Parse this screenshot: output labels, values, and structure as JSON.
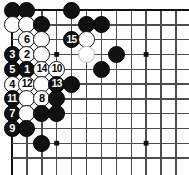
{
  "figure": {
    "kind": "go-board-diagram",
    "width": 189,
    "height": 175,
    "background_color": "#ffffff"
  },
  "board": {
    "line_color": "#4d4d4d",
    "edge_line_color": "#111111",
    "star_point_color": "#111111",
    "origin_x": 12,
    "origin_y": 10,
    "spacing_x": 14.9,
    "spacing_y": 14.8,
    "columns": 12,
    "rows": 11,
    "shows_top_edge": true,
    "shows_left_edge": true,
    "star_points": [
      {
        "col": 4,
        "row": 4
      },
      {
        "col": 10,
        "row": 4
      },
      {
        "col": 4,
        "row": 10
      },
      {
        "col": 10,
        "row": 10
      }
    ]
  },
  "stone_style": {
    "diameter": 17,
    "black_fill": "#111111",
    "black_label_color": "#ffffff",
    "white_fill": "#ffffff",
    "white_outline": "#151515",
    "white_faint_outline": "#b9b9b9"
  },
  "stones": [
    {
      "id": "s-b-c1r1",
      "color": "black",
      "col": 1,
      "row": 1,
      "label": ""
    },
    {
      "id": "s-b-c2r1",
      "color": "black",
      "col": 2,
      "row": 1,
      "label": ""
    },
    {
      "id": "s-b-c5r1",
      "color": "black",
      "col": 5,
      "row": 1,
      "label": ""
    },
    {
      "id": "s-w-c1r2",
      "color": "white",
      "col": 1,
      "row": 2,
      "label": ""
    },
    {
      "id": "s-w-c2r2",
      "color": "white",
      "col": 2,
      "row": 2,
      "label": ""
    },
    {
      "id": "s-b-c3r2",
      "color": "black",
      "col": 3,
      "row": 2,
      "label": ""
    },
    {
      "id": "s-b-c6r2",
      "color": "black",
      "col": 6,
      "row": 2,
      "label": ""
    },
    {
      "id": "s-b-c7r2",
      "color": "black",
      "col": 7,
      "row": 2,
      "label": ""
    },
    {
      "id": "s-w-c2r3",
      "color": "white",
      "col": 2,
      "row": 3,
      "label": "6"
    },
    {
      "id": "s-w-c3r3",
      "color": "white",
      "col": 3,
      "row": 3,
      "label": ""
    },
    {
      "id": "s-b-c5r3",
      "color": "black",
      "col": 5,
      "row": 3,
      "label": "15"
    },
    {
      "id": "s-w-c6r3",
      "color": "white",
      "col": 6,
      "row": 3,
      "label": ""
    },
    {
      "id": "s-b-c1r4",
      "color": "black",
      "col": 1,
      "row": 4,
      "label": "3"
    },
    {
      "id": "s-w-c2r4",
      "color": "white",
      "col": 2,
      "row": 4,
      "label": "2"
    },
    {
      "id": "s-w-c3r4",
      "color": "white",
      "col": 3,
      "row": 4,
      "label": ""
    },
    {
      "id": "s-wf-c6r4",
      "color": "white-faint",
      "col": 6,
      "row": 4,
      "label": ""
    },
    {
      "id": "s-b-c8r4",
      "color": "black",
      "col": 8,
      "row": 4,
      "label": ""
    },
    {
      "id": "s-b-c1r5",
      "color": "black",
      "col": 1,
      "row": 5,
      "label": "5"
    },
    {
      "id": "s-b-c2r5",
      "color": "black",
      "col": 2,
      "row": 5,
      "label": "1"
    },
    {
      "id": "s-w-c3r5",
      "color": "white",
      "col": 3,
      "row": 5,
      "label": "14"
    },
    {
      "id": "s-w-c4r5",
      "color": "white",
      "col": 4,
      "row": 5,
      "label": "10"
    },
    {
      "id": "s-b-c7r5",
      "color": "black",
      "col": 7,
      "row": 5,
      "label": ""
    },
    {
      "id": "s-w-c1r6",
      "color": "white",
      "col": 1,
      "row": 6,
      "label": "4"
    },
    {
      "id": "s-w-c2r6",
      "color": "white",
      "col": 2,
      "row": 6,
      "label": "12"
    },
    {
      "id": "s-w-c3r6",
      "color": "white",
      "col": 3,
      "row": 6,
      "label": ""
    },
    {
      "id": "s-b-c4r6",
      "color": "black",
      "col": 4,
      "row": 6,
      "label": "13"
    },
    {
      "id": "s-b-c5r6",
      "color": "black",
      "col": 5,
      "row": 6,
      "label": ""
    },
    {
      "id": "s-b-c1r7",
      "color": "black",
      "col": 1,
      "row": 7,
      "label": "11"
    },
    {
      "id": "s-w-c2r7",
      "color": "white",
      "col": 2,
      "row": 7,
      "label": ""
    },
    {
      "id": "s-w-c3r7",
      "color": "white",
      "col": 3,
      "row": 7,
      "label": "8"
    },
    {
      "id": "s-b-c4r7",
      "color": "black",
      "col": 4,
      "row": 7,
      "label": ""
    },
    {
      "id": "s-b-c1r8",
      "color": "black",
      "col": 1,
      "row": 8,
      "label": "7"
    },
    {
      "id": "s-w-c2r8",
      "color": "white",
      "col": 2,
      "row": 8,
      "label": ""
    },
    {
      "id": "s-b-c3r8",
      "color": "black",
      "col": 3,
      "row": 8,
      "label": ""
    },
    {
      "id": "s-b-c4r8",
      "color": "black",
      "col": 4,
      "row": 8,
      "label": ""
    },
    {
      "id": "s-b-c1r9",
      "color": "black",
      "col": 1,
      "row": 9,
      "label": "9"
    },
    {
      "id": "s-b-c2r9",
      "color": "black",
      "col": 2,
      "row": 9,
      "label": ""
    },
    {
      "id": "s-b-c3r10",
      "color": "black",
      "col": 3,
      "row": 10,
      "label": ""
    }
  ],
  "move_numbers": [
    "1",
    "2",
    "3",
    "4",
    "5",
    "6",
    "7",
    "8",
    "9",
    "10",
    "11",
    "12",
    "13",
    "14",
    "15"
  ]
}
